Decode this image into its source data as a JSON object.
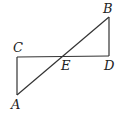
{
  "diagram": {
    "type": "geometry",
    "points": {
      "A": {
        "label": "A",
        "x": 17,
        "y": 95,
        "lx": 15,
        "ly": 108
      },
      "B": {
        "label": "B",
        "x": 109,
        "y": 17,
        "lx": 103,
        "ly": 13
      },
      "C": {
        "label": "C",
        "x": 17,
        "y": 57,
        "lx": 13,
        "ly": 52
      },
      "D": {
        "label": "D",
        "x": 109,
        "y": 56,
        "lx": 104,
        "ly": 70
      },
      "E": {
        "label": "E",
        "x": 62,
        "y": 56,
        "lx": 61,
        "ly": 70
      }
    },
    "segments": [
      {
        "from": "A",
        "to": "B"
      },
      {
        "from": "C",
        "to": "D"
      },
      {
        "from": "A",
        "to": "C"
      },
      {
        "from": "B",
        "to": "D"
      }
    ],
    "colors": {
      "stroke": "#333333",
      "text": "#222222",
      "background": "#ffffff"
    }
  }
}
